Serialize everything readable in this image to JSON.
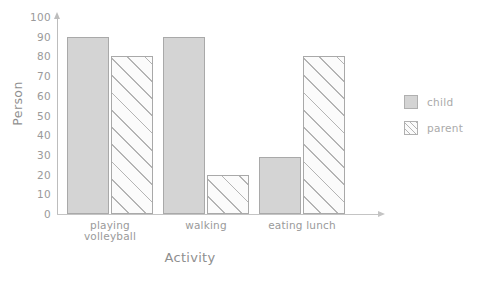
{
  "chart_data": {
    "type": "bar",
    "title": "",
    "xlabel": "Activity",
    "ylabel": "Person",
    "categories": [
      "playing volleyball",
      "walking",
      "eating lunch"
    ],
    "category_lines": [
      [
        "playing",
        "volleyball"
      ],
      [
        "walking"
      ],
      [
        "eating lunch"
      ]
    ],
    "series": [
      {
        "name": "child",
        "values": [
          90,
          90,
          29
        ],
        "color": "#d4d4d4",
        "fill": "solid"
      },
      {
        "name": "parent",
        "values": [
          80,
          20,
          80
        ],
        "color": "#fbfbfb",
        "fill": "diagonal-hatch"
      }
    ],
    "ylim": [
      0,
      100
    ],
    "yticks": [
      0,
      10,
      20,
      30,
      40,
      50,
      60,
      70,
      80,
      90,
      100
    ],
    "ytick_labels": [
      "0",
      "10",
      "20",
      "30",
      "40",
      "50",
      "60",
      "70",
      "80",
      "90",
      "100"
    ],
    "grid": false,
    "legend_position": "right",
    "axis_arrows": true
  },
  "legend": {
    "items": [
      {
        "label": "child"
      },
      {
        "label": "parent"
      }
    ]
  },
  "colors": {
    "axis": "#bdbdbd",
    "text": "#9a9a9a",
    "child_fill": "#d4d4d4",
    "parent_fill": "#fbfbfb",
    "bar_edge": "#a9a9a9",
    "hatch": "#b4b4b4"
  }
}
